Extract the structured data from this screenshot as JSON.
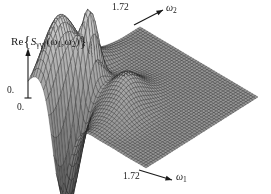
{
  "figure": {
    "kind": "3d-mesh-surface-plot",
    "background_color": "#ffffff",
    "mesh_color": "#2b2b2b",
    "surface_fill": "#9a9a9a",
    "text_color": "#1a1a1a"
  },
  "labels": {
    "zaxis_re": "Re",
    "zaxis_brace_open": "{",
    "zaxis_symbol": "S",
    "zaxis_subscript": "γγγ",
    "zaxis_args_open": "(",
    "zaxis_arg1": "ω",
    "zaxis_arg1_sub": "1",
    "zaxis_comma": ",",
    "zaxis_arg2": "ω",
    "zaxis_arg2_sub": "2",
    "zaxis_args_close": ")",
    "zaxis_brace_close": "}",
    "zaxis_full": "Re{Sγγγ(ω₁,ω₂)}",
    "zero_vertical": "0.",
    "zero_horizontal": "0.",
    "tick_omega2_max": "1.72",
    "tick_omega1_max": "1.72",
    "axis_omega2": "ω",
    "axis_omega2_sub": "2",
    "axis_omega1": "ω",
    "axis_omega1_sub": "1"
  },
  "chart_data": {
    "type": "surface",
    "title": "",
    "subtitle": "",
    "zlabel": "Re{Sγγγ(ω₁,ω₂)}",
    "xlabel": "ω₁",
    "ylabel": "ω₂",
    "xlim": [
      0,
      1.72
    ],
    "ylim": [
      0,
      1.72
    ],
    "xticks": [
      0.0,
      1.72
    ],
    "xticklabels": [
      "0.",
      "1.72"
    ],
    "yticks": [
      0.0,
      1.72
    ],
    "yticklabels": [
      "0.",
      "1.72"
    ],
    "zticks": [
      0.0
    ],
    "zticklabels": [
      "0."
    ],
    "grid": true,
    "mesh": true,
    "legend": false,
    "projection": "axonometric",
    "view": {
      "azimuth_deg": 45,
      "elevation_deg": 28
    },
    "features": [
      {
        "name": "positive-ridge-main",
        "u": 0.12,
        "v": 0.14,
        "z": 0.85,
        "sign": "positive"
      },
      {
        "name": "negative-trough-main",
        "u": 0.3,
        "v": 0.1,
        "z": -1.0,
        "sign": "negative"
      },
      {
        "name": "positive-ridge-secondary",
        "u": 0.42,
        "v": 0.46,
        "z": 0.38,
        "sign": "positive"
      },
      {
        "name": "plateau",
        "u": 0.8,
        "v": 0.8,
        "z": 0.0,
        "sign": "zero"
      }
    ],
    "grid_n": 46,
    "z_amplitude_units": "arbitrary"
  }
}
